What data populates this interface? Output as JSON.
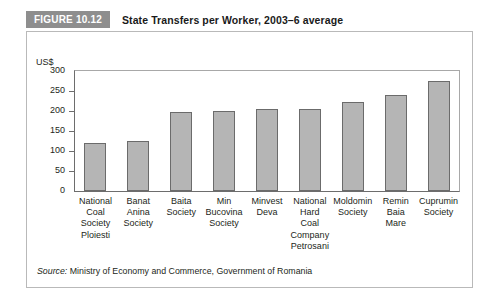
{
  "figure": {
    "badge_label": "FIGURE 10.12",
    "title": "State Transfers per Worker, 2003–6 average",
    "badge_color": "#8e8e8e",
    "bar_fill_color": "#b5b5b5",
    "bar_border_color": "#6b6b6b",
    "frame_color": "#b9b9b9"
  },
  "source": {
    "prefix": "Source:",
    "text": " Ministry of Economy and Commerce, Government of Romania"
  },
  "chart_data": {
    "type": "bar",
    "title": "State Transfers per Worker, 2003–6 average",
    "xlabel": "",
    "ylabel": "US$",
    "ylim": [
      0,
      300
    ],
    "yticks": [
      0,
      50,
      100,
      150,
      200,
      250,
      300
    ],
    "ytick_labels": [
      "0",
      "50",
      "100",
      "150",
      "200",
      "250",
      "300"
    ],
    "grid": false,
    "legend": "none",
    "categories": [
      "National Coal Society Ploiesti",
      "Banat Anina Society",
      "Baita Society",
      "Min Bucovina Society",
      "Minvest Deva",
      "National Hard Coal Company Petrosani",
      "Moldomin Society",
      "Remin Baia Mare",
      "Cuprumin Society"
    ],
    "category_lines": [
      [
        "National",
        "Coal",
        "Society",
        "Ploiesti"
      ],
      [
        "Banat",
        "Anina",
        "Society"
      ],
      [
        "Baita",
        "Society"
      ],
      [
        "Min",
        "Bucovina",
        "Society"
      ],
      [
        "Minvest",
        "Deva"
      ],
      [
        "National",
        "Hard",
        "Coal",
        "Company",
        "Petrosani"
      ],
      [
        "Moldomin",
        "Society"
      ],
      [
        "Remin",
        "Baia",
        "Mare"
      ],
      [
        "Cuprumin",
        "Society"
      ]
    ],
    "values": [
      119,
      125,
      198,
      199,
      205,
      206,
      222,
      240,
      275
    ],
    "value_unit": "US$"
  }
}
